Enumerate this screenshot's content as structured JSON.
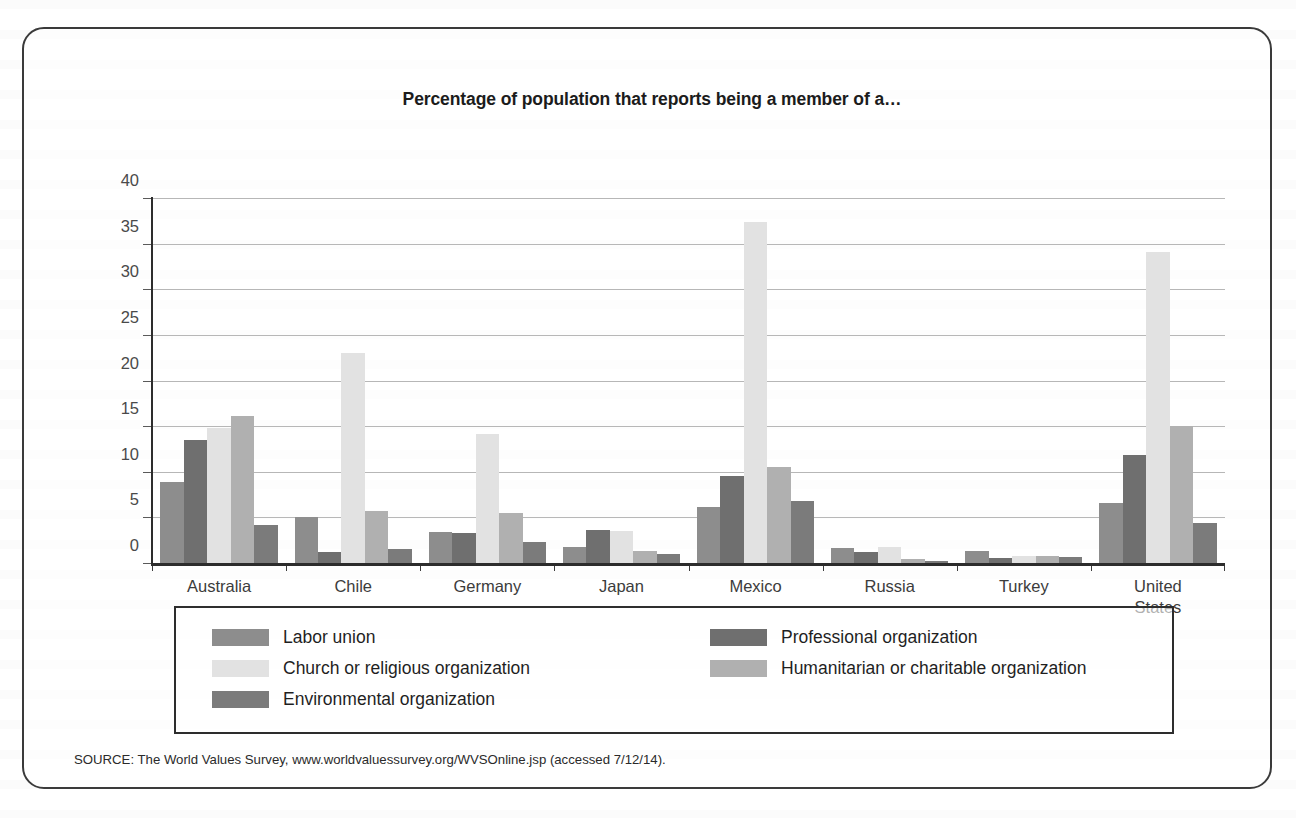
{
  "figure": {
    "title": "Percentage of population that reports being a member of a…",
    "source_note": "SOURCE: The World Values Survey, www.worldvaluessurvey.org/WVSOnline.jsp (accessed 7/12/14)."
  },
  "chart_data": {
    "type": "bar",
    "title": "Percentage of population that reports being a member of a…",
    "xlabel": "",
    "ylabel": "",
    "ylim": [
      0,
      40
    ],
    "ytick_step": 5,
    "yticks": [
      0,
      5,
      10,
      15,
      20,
      25,
      30,
      35,
      40
    ],
    "grid": "horizontal",
    "legend_position": "bottom",
    "categories": [
      "Australia",
      "Chile",
      "Germany",
      "Japan",
      "Mexico",
      "Russia",
      "Turkey",
      "United States"
    ],
    "series": [
      {
        "name": "Labor union",
        "color": "#8d8d8d",
        "values": [
          9.0,
          5.1,
          3.5,
          1.9,
          6.3,
          1.8,
          1.4,
          6.7
        ]
      },
      {
        "name": "Professional organization",
        "color": "#6f6f6f",
        "values": [
          13.6,
          1.3,
          3.4,
          3.7,
          9.6,
          1.3,
          0.7,
          11.9
        ]
      },
      {
        "name": "Church or religious organization",
        "color": "#e2e2e2",
        "values": [
          14.9,
          23.1,
          14.2,
          3.6,
          37.5,
          1.9,
          0.9,
          34.2
        ]
      },
      {
        "name": "Humanitarian or charitable organization",
        "color": "#b0b0b0",
        "values": [
          16.2,
          5.8,
          5.6,
          1.4,
          10.6,
          0.5,
          0.85,
          15.1
        ]
      },
      {
        "name": "Environmental organization",
        "color": "#7b7b7b",
        "values": [
          4.3,
          1.6,
          2.4,
          1.1,
          6.9,
          0.3,
          0.8,
          4.5
        ]
      }
    ]
  },
  "legend": {
    "left_column": [
      "Labor union",
      "Church or religious organization",
      "Environmental organization"
    ],
    "right_column": [
      "Professional organization",
      "Humanitarian or charitable organization"
    ]
  }
}
